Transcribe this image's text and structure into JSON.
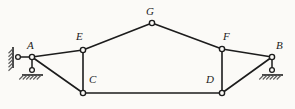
{
  "figure": {
    "background_color": "#fbfaf7",
    "line_color": "#1c1c1c",
    "hatch_color": "#5a5a5a",
    "width": 295,
    "height": 109
  },
  "nodes": [
    {
      "id": "A",
      "label": "A",
      "x": 32,
      "y": 57,
      "label_x": 27,
      "label_y": 40
    },
    {
      "id": "B",
      "label": "B",
      "x": 272,
      "y": 57,
      "label_x": 276,
      "label_y": 40
    },
    {
      "id": "C",
      "label": "C",
      "x": 83,
      "y": 93,
      "label_x": 89,
      "label_y": 74
    },
    {
      "id": "D",
      "label": "D",
      "x": 222,
      "y": 93,
      "label_x": 206,
      "label_y": 74
    },
    {
      "id": "E",
      "label": "E",
      "x": 83,
      "y": 50,
      "label_x": 76,
      "label_y": 31
    },
    {
      "id": "F",
      "label": "F",
      "x": 222,
      "y": 49,
      "label_x": 223,
      "label_y": 31
    },
    {
      "id": "G",
      "label": "G",
      "x": 152,
      "y": 23,
      "label_x": 146,
      "label_y": 6
    }
  ],
  "members": [
    {
      "from": "A",
      "to": "E"
    },
    {
      "from": "E",
      "to": "G"
    },
    {
      "from": "G",
      "to": "F"
    },
    {
      "from": "F",
      "to": "B"
    },
    {
      "from": "A",
      "to": "C"
    },
    {
      "from": "E",
      "to": "C"
    },
    {
      "from": "C",
      "to": "D"
    },
    {
      "from": "F",
      "to": "D"
    },
    {
      "from": "D",
      "to": "B"
    }
  ],
  "supports": [
    {
      "id": "support-A-horizontal-link",
      "node": "A",
      "type": "link-to-wall",
      "orientation": "horizontal",
      "link_start_x": 32,
      "link_start_y": 57,
      "link_end_x": 18,
      "link_end_y": 57,
      "pin_x": 18,
      "pin_y": 57,
      "wall_x": 13,
      "wall_y1": 47,
      "wall_y2": 68,
      "hatch_side": "left"
    },
    {
      "id": "support-A-vertical-link",
      "node": "A",
      "type": "link-to-ground",
      "orientation": "vertical",
      "link_start_x": 32,
      "link_start_y": 57,
      "link_end_x": 32,
      "link_end_y": 70,
      "pin_x": 32,
      "pin_y": 70,
      "ground_y": 75,
      "ground_x1": 22,
      "ground_x2": 43,
      "hatch_side": "below"
    },
    {
      "id": "support-B-vertical-link",
      "node": "B",
      "type": "link-to-ground",
      "orientation": "vertical",
      "link_start_x": 272,
      "link_start_y": 57,
      "link_end_x": 272,
      "link_end_y": 70,
      "pin_x": 272,
      "pin_y": 70,
      "ground_y": 75,
      "ground_x1": 262,
      "ground_x2": 283,
      "hatch_side": "below"
    }
  ],
  "geometry": {
    "joint_radius": 2.6,
    "pin_radius": 2.4,
    "hatch_count": 6,
    "hatch_length": 4.5
  }
}
